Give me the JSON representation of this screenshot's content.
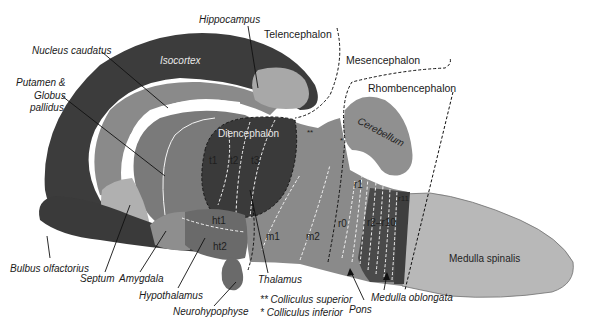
{
  "diagram": {
    "colors": {
      "isocortex": "#3c3c3c",
      "nucleus_caudatus": "#8a8a8a",
      "putamen": "#7a7a7a",
      "hippocampus": "#a8a8a8",
      "diencephalon": "#3a3a3a",
      "mesencephalon": "#8c8c8c",
      "rhombencephalon": "#7c7c7c",
      "r2_r10": "#4a4a4a",
      "cerebellum": "#909090",
      "medulla_spinalis": "#b8b8b8",
      "hypothalamus": "#6a6a6a",
      "bulbus": "#3a3a3a",
      "septum": "#b0b0b0",
      "amygdala": "#8e8e8e"
    },
    "divisions": {
      "telencephalon": "Telencephalon",
      "mesencephalon": "Mesencephalon",
      "rhombencephalon": "Rhombencephalon"
    },
    "inner_labels": {
      "isocortex": "Isocortex",
      "diencephalon": "Diencephalon",
      "cerebellum": "Cerebellum",
      "medulla_spinalis": "Medulla spinalis",
      "t1": "t1",
      "t2": "t2",
      "t3": "t3",
      "ht1": "ht1",
      "ht2": "ht2",
      "m1": "m1",
      "m2": "m2",
      "r0": "r0",
      "r1": "r1",
      "r2_r10": "r2–r10",
      "r11": "r11",
      "colliculus_superior_mark": "**",
      "colliculus_inferior_mark": "*"
    },
    "callouts": {
      "hippocampus": "Hippocampus",
      "nucleus_caudatus": "Nucleus caudatus",
      "putamen_line1": "Putamen &",
      "putamen_line2": "Globus",
      "putamen_line3": "pallidus",
      "bulbus_olfactorius": "Bulbus olfactorius",
      "septum": "Septum",
      "amygdala": "Amygdala",
      "hypothalamus": "Hypothalamus",
      "neurohypophyse": "Neurohypophyse",
      "thalamus": "Thalamus",
      "pons": "Pons",
      "medulla_oblongata": "Medulla oblongata"
    },
    "legend": {
      "superior": "** Colliculus superior",
      "inferior": "*  Colliculus inferior"
    }
  }
}
